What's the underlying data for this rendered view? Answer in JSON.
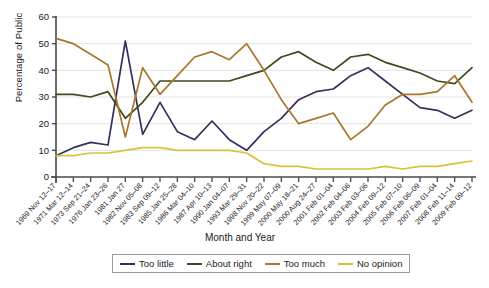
{
  "chart_data": {
    "type": "line",
    "title": "",
    "xlabel": "Month and Year",
    "ylabel": "Percentage of Public",
    "ylim": [
      0,
      60
    ],
    "ytick_step": 10,
    "yticks": [
      0,
      10,
      20,
      30,
      40,
      50,
      60
    ],
    "grid": true,
    "legend_position": "bottom",
    "categories": [
      "1969 Nov 12–17",
      "1971 Mar 12–14",
      "1973 Sep 21–24",
      "1976 Jan 23–26",
      "1981 Jan 27",
      "1982 Nov 05–08",
      "1983 Sep 09–12",
      "1985 Jan 25–28",
      "1986 Mar 04–10",
      "1987 Apr 10–13",
      "1990 Jan 04–07",
      "1993 Mar 29–31",
      "1998 Nov 20–22",
      "1999 May 07–09",
      "2000 May 18–21",
      "2000 Aug 24–27",
      "2001 Feb 01–04",
      "2002 Feb 04–06",
      "2003 Feb 03–06",
      "2004 Feb 09–12",
      "2005 Feb 07–10",
      "2006 Feb 06–09",
      "2007 Feb 01–04",
      "2008 Feb 11–14",
      "2009 Feb 09–12"
    ],
    "series": [
      {
        "name": "Too little",
        "color": "#3b2d5e",
        "values": [
          8,
          11,
          13,
          12,
          51,
          16,
          28,
          17,
          14,
          21,
          14,
          10,
          17,
          22,
          29,
          32,
          33,
          38,
          41,
          36,
          31,
          26,
          25,
          22,
          25
        ]
      },
      {
        "name": "About right",
        "color": "#3f4a1e",
        "values": [
          31,
          31,
          30,
          32,
          22,
          28,
          36,
          36,
          36,
          36,
          36,
          38,
          40,
          45,
          47,
          43,
          40,
          45,
          46,
          43,
          41,
          39,
          36,
          35,
          41
        ]
      },
      {
        "name": "Too much",
        "color": "#a9762b",
        "values": [
          52,
          50,
          46,
          42,
          15,
          41,
          31,
          38,
          45,
          47,
          44,
          50,
          40,
          29,
          20,
          22,
          24,
          14,
          19,
          27,
          31,
          31,
          32,
          38,
          28
        ]
      },
      {
        "name": "No opinion",
        "color": "#d8c23a",
        "values": [
          8,
          8,
          9,
          9,
          10,
          11,
          11,
          10,
          10,
          10,
          10,
          9,
          5,
          4,
          4,
          3,
          3,
          3,
          3,
          4,
          3,
          4,
          4,
          5,
          6
        ]
      }
    ]
  },
  "axes": {
    "ytitle": "Percentage of Public",
    "xtitle": "Month and Year"
  },
  "legend": {
    "items": [
      {
        "label": "Too little",
        "color": "#3b2d5e"
      },
      {
        "label": "About right",
        "color": "#3f4a1e"
      },
      {
        "label": "Too much",
        "color": "#a9762b"
      },
      {
        "label": "No opinion",
        "color": "#d8c23a"
      }
    ]
  }
}
